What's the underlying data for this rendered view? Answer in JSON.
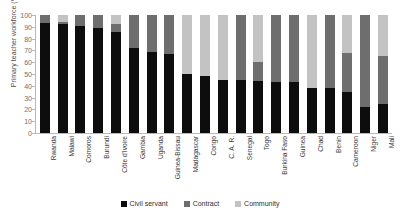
{
  "chart_data": {
    "type": "bar",
    "subtype": "stacked-bar-100",
    "title": "",
    "xlabel": "",
    "ylabel": "Primary teacher workforce (%)",
    "ylim": [
      0,
      100
    ],
    "yticks": [
      0,
      10,
      20,
      30,
      40,
      50,
      60,
      70,
      80,
      90,
      100
    ],
    "grid": false,
    "legend_position": "bottom-center",
    "categories": [
      "Rwanda",
      "Malawi",
      "Comoros",
      "Burundi",
      "Côte d'Ivoire",
      "Gambia",
      "Uganda",
      "Guinea-Bissau",
      "Madagascar",
      "Congo",
      "C. A. R.",
      "Senegal",
      "Togo",
      "Burkina Faso",
      "Guinea",
      "Chad",
      "Benin",
      "Cameroon",
      "Niger",
      "Mali"
    ],
    "series": [
      {
        "name": "Civil servant",
        "color": "#0d0d0d",
        "values": [
          93,
          92,
          91,
          89,
          86,
          72,
          69,
          67,
          50,
          48,
          45,
          45,
          44,
          43,
          43,
          38,
          38,
          35,
          22,
          25
        ]
      },
      {
        "name": "Contract",
        "color": "#6e6e6e",
        "values": [
          7,
          2,
          9,
          11,
          6,
          28,
          31,
          33,
          0,
          0,
          0,
          55,
          16,
          57,
          57,
          0,
          62,
          33,
          78,
          40
        ]
      },
      {
        "name": "Community",
        "color": "#c3c3c3",
        "values": [
          0,
          6,
          0,
          0,
          8,
          0,
          0,
          0,
          50,
          52,
          55,
          0,
          40,
          0,
          0,
          62,
          0,
          32,
          0,
          35
        ]
      }
    ]
  },
  "axis": {
    "y_label": "Primary teacher workforce (%)",
    "y_ticks": [
      "100",
      "90",
      "80",
      "70",
      "60",
      "50",
      "40",
      "30",
      "20",
      "10",
      "0"
    ]
  },
  "legend": {
    "items": [
      {
        "label": "Civil servant",
        "color": "#0d0d0d"
      },
      {
        "label": "Contract",
        "color": "#6e6e6e"
      },
      {
        "label": "Community",
        "color": "#c3c3c3"
      }
    ]
  }
}
